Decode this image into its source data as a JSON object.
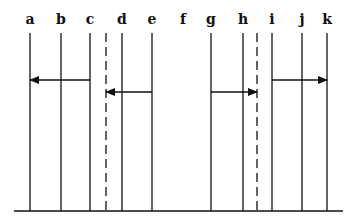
{
  "diagram": {
    "colors": {
      "ink": "#111111",
      "background": "#ffffff"
    },
    "label_y": 24,
    "line_top": 33,
    "baseline_y": 211,
    "baseline": {
      "x1": 14,
      "x2": 343
    },
    "lines": [
      {
        "label": "a",
        "x": 30,
        "style": "solid"
      },
      {
        "label": "b",
        "x": 61,
        "style": "solid"
      },
      {
        "label": "c",
        "x": 90,
        "style": "solid"
      },
      {
        "label": "",
        "x": 106,
        "style": "dashed"
      },
      {
        "label": "d",
        "x": 122,
        "style": "solid"
      },
      {
        "label": "e",
        "x": 152,
        "style": "solid"
      },
      {
        "label": "f",
        "x": 183,
        "style": "none"
      },
      {
        "label": "g",
        "x": 211,
        "style": "solid"
      },
      {
        "label": "h",
        "x": 243,
        "style": "solid"
      },
      {
        "label": "",
        "x": 257,
        "style": "dashed"
      },
      {
        "label": "i",
        "x": 272,
        "style": "solid"
      },
      {
        "label": "j",
        "x": 302,
        "style": "solid"
      },
      {
        "label": "k",
        "x": 327,
        "style": "solid"
      }
    ],
    "arrows": [
      {
        "from": "c",
        "to": "a",
        "x1": 90,
        "x2": 30,
        "y": 80
      },
      {
        "from": "e",
        "to": "dashed-left",
        "x1": 152,
        "x2": 106,
        "y": 92
      },
      {
        "from": "g",
        "to": "dashed-right",
        "x1": 211,
        "x2": 257,
        "y": 92
      },
      {
        "from": "i",
        "to": "k",
        "x1": 272,
        "x2": 327,
        "y": 80
      }
    ]
  }
}
